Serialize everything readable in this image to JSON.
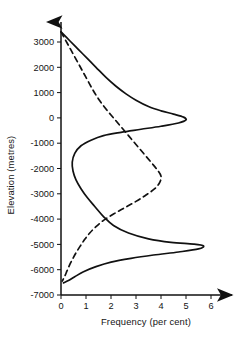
{
  "chart_data": {
    "type": "line",
    "title": "",
    "xlabel": "Frequency (per cent)",
    "ylabel": "Elevation (metres)",
    "xlim": [
      0,
      6.6
    ],
    "ylim": [
      -7000,
      3600
    ],
    "grid": false,
    "legend": "none",
    "orientation": "horizontal-frequency-vertical-elevation",
    "xticks": [
      0,
      1,
      2,
      3,
      4,
      5,
      6
    ],
    "xticklabels": [
      "0",
      "1",
      "2",
      "3",
      "4",
      "5",
      "6"
    ],
    "yticks": [
      3000,
      2000,
      1000,
      0,
      -1000,
      -2000,
      -3000,
      -4000,
      -5000,
      -6000,
      -7000
    ],
    "yticklabels": [
      "3000",
      "2000",
      "1000",
      "0",
      "-1000",
      "-2000",
      "-3000",
      "-4000",
      "-5000",
      "-6000",
      "-7000"
    ],
    "series": [
      {
        "name": "hypsometric-frequency-solid",
        "style": "solid",
        "color": "#111111",
        "points": [
          {
            "frequency": 0.0,
            "elevation": 3400
          },
          {
            "frequency": 0.35,
            "elevation": 3050
          },
          {
            "frequency": 0.7,
            "elevation": 2700
          },
          {
            "frequency": 1.05,
            "elevation": 2350
          },
          {
            "frequency": 1.4,
            "elevation": 2000
          },
          {
            "frequency": 1.8,
            "elevation": 1600
          },
          {
            "frequency": 2.2,
            "elevation": 1250
          },
          {
            "frequency": 2.6,
            "elevation": 950
          },
          {
            "frequency": 3.0,
            "elevation": 700
          },
          {
            "frequency": 3.5,
            "elevation": 450
          },
          {
            "frequency": 4.0,
            "elevation": 280
          },
          {
            "frequency": 4.5,
            "elevation": 150
          },
          {
            "frequency": 4.9,
            "elevation": 30
          },
          {
            "frequency": 5.0,
            "elevation": -80
          },
          {
            "frequency": 4.7,
            "elevation": -200
          },
          {
            "frequency": 4.0,
            "elevation": -330
          },
          {
            "frequency": 3.2,
            "elevation": -450
          },
          {
            "frequency": 2.4,
            "elevation": -570
          },
          {
            "frequency": 1.7,
            "elevation": -700
          },
          {
            "frequency": 1.2,
            "elevation": -880
          },
          {
            "frequency": 0.8,
            "elevation": -1100
          },
          {
            "frequency": 0.55,
            "elevation": -1400
          },
          {
            "frequency": 0.45,
            "elevation": -1750
          },
          {
            "frequency": 0.48,
            "elevation": -2100
          },
          {
            "frequency": 0.6,
            "elevation": -2450
          },
          {
            "frequency": 0.8,
            "elevation": -2800
          },
          {
            "frequency": 1.05,
            "elevation": -3150
          },
          {
            "frequency": 1.35,
            "elevation": -3500
          },
          {
            "frequency": 1.7,
            "elevation": -3900
          },
          {
            "frequency": 2.1,
            "elevation": -4250
          },
          {
            "frequency": 2.7,
            "elevation": -4550
          },
          {
            "frequency": 3.5,
            "elevation": -4780
          },
          {
            "frequency": 4.4,
            "elevation": -4920
          },
          {
            "frequency": 5.3,
            "elevation": -4990
          },
          {
            "frequency": 5.7,
            "elevation": -5060
          },
          {
            "frequency": 5.5,
            "elevation": -5180
          },
          {
            "frequency": 4.7,
            "elevation": -5300
          },
          {
            "frequency": 3.7,
            "elevation": -5420
          },
          {
            "frequency": 2.8,
            "elevation": -5550
          },
          {
            "frequency": 2.0,
            "elevation": -5700
          },
          {
            "frequency": 1.4,
            "elevation": -5880
          },
          {
            "frequency": 0.9,
            "elevation": -6080
          },
          {
            "frequency": 0.55,
            "elevation": -6280
          },
          {
            "frequency": 0.3,
            "elevation": -6430
          },
          {
            "frequency": 0.1,
            "elevation": -6520
          }
        ]
      },
      {
        "name": "cumulative-frequency-dashed",
        "style": "dashed",
        "color": "#111111",
        "points": [
          {
            "frequency": 0.0,
            "elevation": 3400
          },
          {
            "frequency": 0.25,
            "elevation": 2950
          },
          {
            "frequency": 0.5,
            "elevation": 2500
          },
          {
            "frequency": 0.75,
            "elevation": 2050
          },
          {
            "frequency": 1.0,
            "elevation": 1600
          },
          {
            "frequency": 1.25,
            "elevation": 1150
          },
          {
            "frequency": 1.5,
            "elevation": 750
          },
          {
            "frequency": 1.8,
            "elevation": 350
          },
          {
            "frequency": 2.1,
            "elevation": 0
          },
          {
            "frequency": 2.4,
            "elevation": -350
          },
          {
            "frequency": 2.7,
            "elevation": -700
          },
          {
            "frequency": 3.0,
            "elevation": -1050
          },
          {
            "frequency": 3.3,
            "elevation": -1400
          },
          {
            "frequency": 3.6,
            "elevation": -1750
          },
          {
            "frequency": 3.85,
            "elevation": -2050
          },
          {
            "frequency": 4.0,
            "elevation": -2300
          },
          {
            "frequency": 3.95,
            "elevation": -2550
          },
          {
            "frequency": 3.75,
            "elevation": -2800
          },
          {
            "frequency": 3.4,
            "elevation": -3050
          },
          {
            "frequency": 3.0,
            "elevation": -3300
          },
          {
            "frequency": 2.55,
            "elevation": -3550
          },
          {
            "frequency": 2.1,
            "elevation": -3800
          },
          {
            "frequency": 1.7,
            "elevation": -4050
          },
          {
            "frequency": 1.4,
            "elevation": -4300
          },
          {
            "frequency": 1.15,
            "elevation": -4550
          },
          {
            "frequency": 0.95,
            "elevation": -4800
          },
          {
            "frequency": 0.78,
            "elevation": -5050
          },
          {
            "frequency": 0.62,
            "elevation": -5300
          },
          {
            "frequency": 0.48,
            "elevation": -5550
          },
          {
            "frequency": 0.35,
            "elevation": -5800
          },
          {
            "frequency": 0.24,
            "elevation": -6050
          },
          {
            "frequency": 0.14,
            "elevation": -6280
          },
          {
            "frequency": 0.05,
            "elevation": -6450
          }
        ]
      }
    ],
    "annotations": {
      "solid_peak_upper": {
        "frequency": 5.0,
        "elevation": -50
      },
      "solid_peak_lower": {
        "frequency": 5.7,
        "elevation": -5050
      },
      "solid_minimum": {
        "frequency": 0.45,
        "elevation": -1750
      },
      "dashed_peak": {
        "frequency": 4.0,
        "elevation": -2300
      }
    }
  }
}
